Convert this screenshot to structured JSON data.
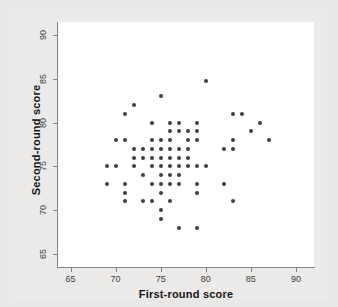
{
  "chart_data": {
    "type": "scatter",
    "title": "",
    "xlabel": "First-round score",
    "ylabel": "Second-round score",
    "xlim": [
      63.5,
      92
    ],
    "ylim": [
      63.5,
      91.5
    ],
    "xticks": [
      65,
      70,
      75,
      80,
      85,
      90
    ],
    "yticks": [
      65,
      70,
      75,
      80,
      85,
      90
    ],
    "grid": false,
    "legend": null,
    "marker": {
      "shape": "circle",
      "color": "#3f3e3d",
      "size": 4
    },
    "points": [
      {
        "x": 69,
        "y": 75
      },
      {
        "x": 69,
        "y": 73
      },
      {
        "x": 70,
        "y": 78
      },
      {
        "x": 70,
        "y": 75
      },
      {
        "x": 71,
        "y": 81
      },
      {
        "x": 71,
        "y": 78
      },
      {
        "x": 71,
        "y": 73
      },
      {
        "x": 71,
        "y": 72
      },
      {
        "x": 71,
        "y": 71
      },
      {
        "x": 72,
        "y": 82
      },
      {
        "x": 72,
        "y": 77
      },
      {
        "x": 72,
        "y": 76
      },
      {
        "x": 72,
        "y": 75
      },
      {
        "x": 73,
        "y": 77
      },
      {
        "x": 73,
        "y": 76
      },
      {
        "x": 73,
        "y": 74
      },
      {
        "x": 73,
        "y": 71
      },
      {
        "x": 74,
        "y": 80
      },
      {
        "x": 74,
        "y": 78
      },
      {
        "x": 74,
        "y": 77
      },
      {
        "x": 74,
        "y": 76
      },
      {
        "x": 74,
        "y": 75
      },
      {
        "x": 74,
        "y": 73
      },
      {
        "x": 74,
        "y": 71
      },
      {
        "x": 75,
        "y": 83
      },
      {
        "x": 75,
        "y": 78
      },
      {
        "x": 75,
        "y": 77
      },
      {
        "x": 75,
        "y": 76
      },
      {
        "x": 75,
        "y": 75
      },
      {
        "x": 75,
        "y": 74
      },
      {
        "x": 75,
        "y": 73
      },
      {
        "x": 75,
        "y": 72
      },
      {
        "x": 75,
        "y": 70
      },
      {
        "x": 75,
        "y": 69
      },
      {
        "x": 76,
        "y": 80
      },
      {
        "x": 76,
        "y": 79
      },
      {
        "x": 76,
        "y": 78
      },
      {
        "x": 76,
        "y": 77
      },
      {
        "x": 76,
        "y": 76
      },
      {
        "x": 76,
        "y": 75
      },
      {
        "x": 76,
        "y": 74
      },
      {
        "x": 76,
        "y": 73
      },
      {
        "x": 76,
        "y": 71
      },
      {
        "x": 77,
        "y": 80
      },
      {
        "x": 77,
        "y": 79
      },
      {
        "x": 77,
        "y": 77
      },
      {
        "x": 77,
        "y": 76
      },
      {
        "x": 77,
        "y": 75
      },
      {
        "x": 77,
        "y": 74
      },
      {
        "x": 77,
        "y": 73
      },
      {
        "x": 77,
        "y": 68
      },
      {
        "x": 78,
        "y": 79
      },
      {
        "x": 78,
        "y": 78
      },
      {
        "x": 78,
        "y": 77
      },
      {
        "x": 78,
        "y": 76
      },
      {
        "x": 78,
        "y": 75
      },
      {
        "x": 79,
        "y": 80
      },
      {
        "x": 79,
        "y": 79
      },
      {
        "x": 79,
        "y": 78
      },
      {
        "x": 79,
        "y": 75
      },
      {
        "x": 79,
        "y": 73
      },
      {
        "x": 79,
        "y": 72
      },
      {
        "x": 79,
        "y": 68
      },
      {
        "x": 80,
        "y": 84.8
      },
      {
        "x": 80,
        "y": 75
      },
      {
        "x": 82,
        "y": 77
      },
      {
        "x": 82,
        "y": 73
      },
      {
        "x": 83,
        "y": 81
      },
      {
        "x": 83,
        "y": 78
      },
      {
        "x": 83,
        "y": 77
      },
      {
        "x": 83,
        "y": 71
      },
      {
        "x": 84,
        "y": 81
      },
      {
        "x": 85,
        "y": 79
      },
      {
        "x": 86,
        "y": 80
      },
      {
        "x": 87,
        "y": 78
      }
    ]
  }
}
